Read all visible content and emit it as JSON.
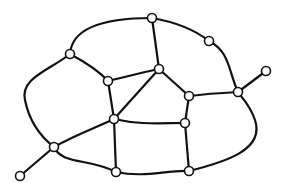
{
  "diagram": {
    "type": "network-graph",
    "nodes": [
      {
        "id": "A",
        "x": 152,
        "y": 18
      },
      {
        "id": "B",
        "x": 209,
        "y": 41
      },
      {
        "id": "C",
        "x": 70,
        "y": 54
      },
      {
        "id": "D",
        "x": 108,
        "y": 81
      },
      {
        "id": "E",
        "x": 159,
        "y": 69
      },
      {
        "id": "F",
        "x": 266,
        "y": 71
      },
      {
        "id": "G",
        "x": 238,
        "y": 92
      },
      {
        "id": "H",
        "x": 189,
        "y": 96
      },
      {
        "id": "I",
        "x": 114,
        "y": 119
      },
      {
        "id": "J",
        "x": 185,
        "y": 123
      },
      {
        "id": "K",
        "x": 54,
        "y": 147
      },
      {
        "id": "L",
        "x": 20,
        "y": 176
      },
      {
        "id": "M",
        "x": 116,
        "y": 172
      },
      {
        "id": "N",
        "x": 189,
        "y": 171
      }
    ],
    "edges": [
      {
        "id": "C-A",
        "d": "M70,54 C72,25 110,18 152,18"
      },
      {
        "id": "A-B",
        "d": "M152,18 C175,22 195,30 209,41"
      },
      {
        "id": "B-G",
        "d": "M209,41 C230,52 228,70 238,92"
      },
      {
        "id": "A-E",
        "d": "M152,18 L159,69"
      },
      {
        "id": "G-F",
        "d": "M238,92 L266,71"
      },
      {
        "id": "G-H",
        "d": "M238,92 C220,93 205,94 189,96"
      },
      {
        "id": "H-E",
        "d": "M189,96 L159,69"
      },
      {
        "id": "E-D",
        "d": "M159,69 C140,73 125,77 108,81"
      },
      {
        "id": "E-I",
        "d": "M159,69 L114,119"
      },
      {
        "id": "C-D",
        "d": "M70,54 C85,62 98,70 108,81"
      },
      {
        "id": "D-I",
        "d": "M108,81 L114,119"
      },
      {
        "id": "C-K",
        "d": "M70,54 C50,70 20,78 25,100 C30,125 45,140 54,147"
      },
      {
        "id": "K-L",
        "d": "M54,147 L20,176"
      },
      {
        "id": "K-I",
        "d": "M54,147 C75,135 95,128 114,119"
      },
      {
        "id": "K-M",
        "d": "M54,147 C62,165 90,158 116,172"
      },
      {
        "id": "I-J",
        "d": "M114,119 C140,125 160,123 185,123"
      },
      {
        "id": "I-M",
        "d": "M114,119 L116,172"
      },
      {
        "id": "H-J",
        "d": "M189,96 L185,123"
      },
      {
        "id": "J-N",
        "d": "M185,123 L189,171"
      },
      {
        "id": "M-N",
        "d": "M116,172 C145,178 165,170 189,171"
      },
      {
        "id": "N-G",
        "d": "M189,171 C225,162 265,150 255,120 C250,105 242,98 238,92"
      }
    ],
    "node_radius": 4.5,
    "colors": {
      "stroke": "#111111",
      "node_fill": "#ffffff",
      "background": "#ffffff"
    }
  }
}
